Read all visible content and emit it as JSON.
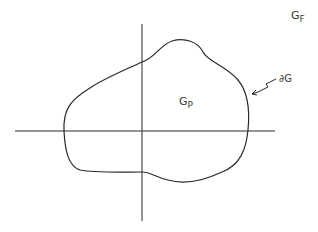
{
  "diagram": {
    "labels": {
      "outer_region": {
        "main": "G",
        "sub": "F"
      },
      "inner_region": {
        "main": "G",
        "sub": "P"
      },
      "boundary": "∂G"
    },
    "colors": {
      "stroke": "#2a2a2a",
      "background": "#ffffff"
    }
  }
}
